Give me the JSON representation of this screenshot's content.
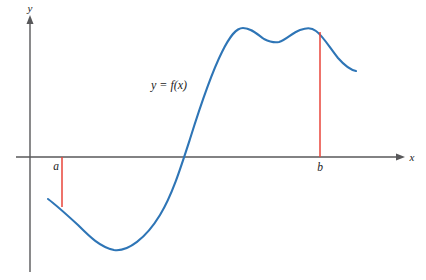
{
  "figure": {
    "kind": "function-graph",
    "background_color": "#ffffff",
    "axis_color": "#58585a",
    "curve_color": "#2e75b6",
    "ordinate_color": "#e8443a",
    "label_color": "#1c1c1c"
  },
  "axes": {
    "x_label": "x",
    "y_label": "y",
    "origin": {
      "x": 30,
      "y": 157
    },
    "x_axis_start": {
      "x": 16,
      "y": 157
    },
    "x_axis_end": {
      "x": 404,
      "y": 157
    },
    "y_axis_top": {
      "x": 30,
      "y": 16
    },
    "y_axis_bottom": {
      "x": 30,
      "y": 272
    },
    "has_x_arrow": true,
    "has_y_arrow": true,
    "ticks": [],
    "grid": false
  },
  "annotations": {
    "curve_label": "y = f(x)",
    "curve_label_pos": {
      "x": 151,
      "y": 89
    },
    "point_a_label": "a",
    "point_a_label_pos": {
      "x": 56,
      "y": 170
    },
    "point_b_label": "b",
    "point_b_label_pos": {
      "x": 318,
      "y": 170
    }
  },
  "ordinates": [
    {
      "name": "a",
      "x": 62,
      "y_top": 157,
      "y_bottom": 207,
      "color": "#e8443a"
    },
    {
      "name": "b",
      "x": 320,
      "y_top": 32,
      "y_bottom": 157,
      "color": "#e8443a"
    }
  ],
  "chart_data": {
    "type": "line",
    "title": "",
    "xlabel": "x",
    "ylabel": "y",
    "series": [
      {
        "name": "y = f(x)",
        "color": "#2e75b6",
        "points_px": [
          [
            48,
            199
          ],
          [
            62,
            207
          ],
          [
            78,
            224
          ],
          [
            95,
            241
          ],
          [
            107,
            248
          ],
          [
            122,
            250
          ],
          [
            140,
            240
          ],
          [
            155,
            221
          ],
          [
            168,
            196
          ],
          [
            182,
            157
          ],
          [
            196,
            118
          ],
          [
            210,
            80
          ],
          [
            224,
            48
          ],
          [
            234,
            33
          ],
          [
            241,
            28
          ],
          [
            252,
            29
          ],
          [
            263,
            36
          ],
          [
            272,
            41
          ],
          [
            278,
            42
          ],
          [
            288,
            38
          ],
          [
            299,
            31
          ],
          [
            308,
            28
          ],
          [
            313,
            29
          ],
          [
            322,
            35
          ],
          [
            332,
            48
          ],
          [
            342,
            61
          ],
          [
            350,
            68
          ],
          [
            356,
            71
          ]
        ],
        "features": {
          "left_endpoint": [
            48,
            199
          ],
          "local_minimum": [
            114,
            250
          ],
          "x_intercept": [
            182,
            157
          ],
          "first_peak": [
            241,
            28
          ],
          "valley_between_peaks": [
            278,
            42
          ],
          "second_peak": [
            312,
            28
          ],
          "right_endpoint": [
            356,
            71
          ]
        }
      }
    ],
    "legend": false,
    "legend_position": "none"
  }
}
